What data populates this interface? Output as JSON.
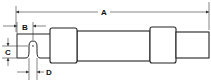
{
  "diagram": {
    "dimensions": [
      {
        "id": "A",
        "label": "A",
        "meaning": "overall length"
      },
      {
        "id": "B",
        "label": "B",
        "meaning": "tab offset to slot center"
      },
      {
        "id": "C",
        "label": "C",
        "meaning": "tab height"
      },
      {
        "id": "D",
        "label": "D",
        "meaning": "slot width"
      }
    ]
  }
}
